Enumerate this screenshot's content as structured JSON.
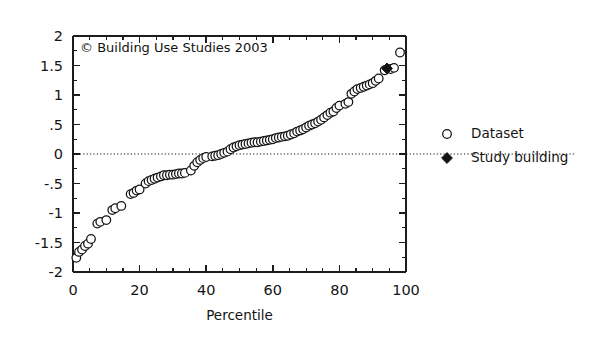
{
  "chart_data": {
    "type": "scatter",
    "title": "",
    "subtitle": "",
    "xlabel": "Percentile",
    "ylabel": "",
    "xlim": [
      0,
      100
    ],
    "ylim": [
      -2,
      2
    ],
    "grid": false,
    "zero_reference_line": 0,
    "x_ticks": [
      0,
      20,
      40,
      60,
      80,
      100
    ],
    "x_tick_labels": [
      "0",
      "20",
      "40",
      "60",
      "80",
      "100"
    ],
    "x_minor_tick_step": 5,
    "y_ticks": [
      2,
      1.5,
      1,
      0.5,
      0,
      -0.5,
      -1,
      -1.5,
      -2
    ],
    "y_tick_labels": [
      "2",
      "1.5",
      "1",
      ".5",
      "0",
      "-.5",
      "-1",
      "-1.5",
      "-2"
    ],
    "y_minor_tick_step": 0.25,
    "annotation": "© Building Use Studies 2003",
    "legend_position": "right",
    "legend": [
      {
        "label": "Dataset",
        "marker": "open-circle"
      },
      {
        "label": "Study building",
        "marker": "filled-diamond"
      }
    ],
    "series": [
      {
        "name": "Dataset",
        "marker": "open-circle",
        "color": "#141414",
        "points": [
          [
            1.0,
            -1.76
          ],
          [
            1.8,
            -1.66
          ],
          [
            2.7,
            -1.62
          ],
          [
            3.6,
            -1.56
          ],
          [
            4.5,
            -1.52
          ],
          [
            5.4,
            -1.44
          ],
          [
            7.3,
            -1.18
          ],
          [
            8.2,
            -1.15
          ],
          [
            10.0,
            -1.12
          ],
          [
            11.8,
            -0.95
          ],
          [
            12.7,
            -0.92
          ],
          [
            14.5,
            -0.88
          ],
          [
            17.3,
            -0.68
          ],
          [
            18.2,
            -0.66
          ],
          [
            19.1,
            -0.62
          ],
          [
            20.0,
            -0.6
          ],
          [
            21.8,
            -0.5
          ],
          [
            22.7,
            -0.46
          ],
          [
            23.6,
            -0.44
          ],
          [
            24.5,
            -0.42
          ],
          [
            25.4,
            -0.4
          ],
          [
            26.4,
            -0.38
          ],
          [
            27.3,
            -0.36
          ],
          [
            28.2,
            -0.36
          ],
          [
            29.1,
            -0.35
          ],
          [
            30.0,
            -0.35
          ],
          [
            30.9,
            -0.34
          ],
          [
            31.8,
            -0.33
          ],
          [
            32.7,
            -0.33
          ],
          [
            33.6,
            -0.32
          ],
          [
            35.4,
            -0.28
          ],
          [
            36.4,
            -0.2
          ],
          [
            37.3,
            -0.14
          ],
          [
            38.2,
            -0.1
          ],
          [
            39.1,
            -0.07
          ],
          [
            40.0,
            -0.05
          ],
          [
            41.8,
            -0.04
          ],
          [
            42.7,
            -0.03
          ],
          [
            43.6,
            -0.02
          ],
          [
            44.5,
            0.0
          ],
          [
            45.4,
            0.02
          ],
          [
            46.4,
            0.04
          ],
          [
            47.3,
            0.08
          ],
          [
            48.2,
            0.11
          ],
          [
            49.1,
            0.13
          ],
          [
            50.0,
            0.15
          ],
          [
            50.9,
            0.16
          ],
          [
            51.8,
            0.17
          ],
          [
            52.7,
            0.18
          ],
          [
            53.6,
            0.19
          ],
          [
            54.5,
            0.2
          ],
          [
            55.4,
            0.2
          ],
          [
            56.4,
            0.21
          ],
          [
            57.3,
            0.22
          ],
          [
            58.2,
            0.23
          ],
          [
            59.1,
            0.24
          ],
          [
            60.0,
            0.25
          ],
          [
            60.9,
            0.27
          ],
          [
            61.8,
            0.28
          ],
          [
            62.7,
            0.29
          ],
          [
            63.6,
            0.3
          ],
          [
            64.5,
            0.31
          ],
          [
            65.4,
            0.33
          ],
          [
            66.4,
            0.35
          ],
          [
            67.3,
            0.38
          ],
          [
            68.2,
            0.4
          ],
          [
            69.1,
            0.42
          ],
          [
            70.0,
            0.45
          ],
          [
            70.9,
            0.48
          ],
          [
            71.8,
            0.5
          ],
          [
            72.7,
            0.52
          ],
          [
            73.6,
            0.55
          ],
          [
            74.5,
            0.58
          ],
          [
            75.4,
            0.62
          ],
          [
            76.4,
            0.66
          ],
          [
            77.3,
            0.7
          ],
          [
            78.2,
            0.72
          ],
          [
            79.1,
            0.78
          ],
          [
            80.0,
            0.82
          ],
          [
            81.8,
            0.85
          ],
          [
            82.7,
            0.88
          ],
          [
            83.6,
            1.02
          ],
          [
            84.5,
            1.06
          ],
          [
            85.4,
            1.1
          ],
          [
            86.4,
            1.12
          ],
          [
            87.3,
            1.14
          ],
          [
            88.2,
            1.16
          ],
          [
            89.1,
            1.18
          ],
          [
            90.0,
            1.2
          ],
          [
            90.9,
            1.24
          ],
          [
            91.8,
            1.28
          ],
          [
            93.6,
            1.42
          ],
          [
            95.4,
            1.44
          ],
          [
            96.4,
            1.46
          ],
          [
            98.2,
            1.72
          ]
        ]
      },
      {
        "name": "Study building",
        "marker": "filled-diamond",
        "color": "#141414",
        "points": [
          [
            94.3,
            1.45
          ]
        ]
      }
    ]
  },
  "figure": {
    "background_color": "#ffffff",
    "axis_color": "#1c1c1c",
    "marker_edge_color": "#141414",
    "marker_fill_color": "#ffffff",
    "study_marker_color": "#141414"
  }
}
